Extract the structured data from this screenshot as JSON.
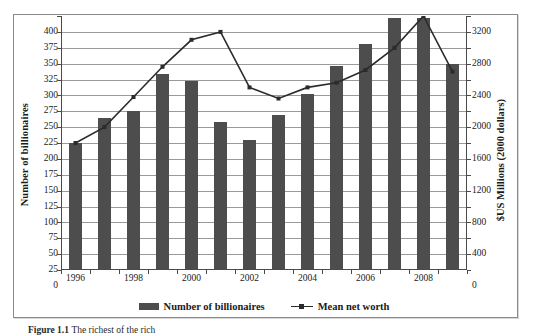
{
  "figure": {
    "caption_label": "Figure 1.1",
    "caption_text": "The richest of the rich"
  },
  "legend": {
    "position": "bottom-center",
    "entries": [
      {
        "label": "Number of billionaires",
        "marker": "bar-swatch",
        "color": "#4d4d4d"
      },
      {
        "label": "Mean net worth",
        "marker": "line-marker",
        "color": "#2b2b2b"
      }
    ]
  },
  "axes": {
    "left_title": "Number of billionaires",
    "right_title": "$US Millions (2000 dollars)",
    "left_ticks": [
      "0",
      "25",
      "50",
      "75",
      "100",
      "125",
      "150",
      "175",
      "200",
      "225",
      "250",
      "275",
      "300",
      "325",
      "350",
      "375",
      "400"
    ],
    "right_ticks": [
      "0",
      "400",
      "800",
      "1200",
      "1600",
      "2000",
      "2400",
      "2800",
      "3200"
    ],
    "x_ticks_shown": [
      "1996",
      "1998",
      "2000",
      "2002",
      "2004",
      "2006",
      "2008"
    ]
  },
  "chart_data": {
    "type": "bar",
    "title": "The richest of the rich",
    "xlabel": "",
    "ylabel": "Number of billionaires",
    "y2label": "$US Millions (2000 dollars)",
    "grid": true,
    "legend_position": "bottom",
    "categories": [
      "1996",
      "1997",
      "1998",
      "1999",
      "2000",
      "2001",
      "2002",
      "2003",
      "2004",
      "2005",
      "2006",
      "2007",
      "2008",
      "2009"
    ],
    "ylim": [
      0,
      400
    ],
    "y2lim": [
      0,
      3200
    ],
    "ytick_step": 25,
    "y2tick_step": 400,
    "series": [
      {
        "name": "Number of billionaires",
        "type": "bar",
        "axis": "left",
        "color": "#4d4d4d",
        "values": [
          200,
          240,
          250,
          308,
          298,
          233,
          205,
          244,
          277,
          322,
          356,
          397,
          397,
          325
        ]
      },
      {
        "name": "Mean net worth",
        "type": "line",
        "axis": "right",
        "color": "#2b2b2b",
        "values": [
          1600,
          1800,
          2180,
          2560,
          2900,
          3000,
          2300,
          2160,
          2300,
          2360,
          2520,
          2800,
          3200,
          2500
        ]
      }
    ]
  }
}
